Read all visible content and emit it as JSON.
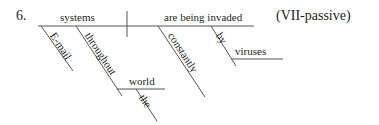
{
  "item_number": "6.",
  "label": "(VII-passive)",
  "words": {
    "subject": "systems",
    "verb": "are being invaded",
    "subject_modifier_1": "E-mail",
    "subject_modifier_2": "throughout",
    "prep_object": "world",
    "prep_object_modifier": "the",
    "verb_modifier_1": "constantly",
    "verb_modifier_2": "by",
    "agent_object": "viruses"
  },
  "colors": {
    "line": "#555555",
    "text": "#231f20"
  }
}
